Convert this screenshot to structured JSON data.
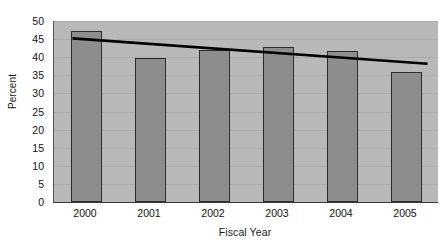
{
  "chart_data": {
    "type": "bar",
    "title": "",
    "subtitle": "",
    "xlabel": "Fiscal Year",
    "ylabel": "Percent",
    "categories": [
      "2000",
      "2001",
      "2002",
      "2003",
      "2004",
      "2005"
    ],
    "values": [
      47.2,
      39.8,
      42.0,
      42.8,
      41.7,
      35.8
    ],
    "series": [
      {
        "name": "Percent",
        "type": "bar",
        "values": [
          47.2,
          39.8,
          42.0,
          42.8,
          41.7,
          35.8
        ]
      },
      {
        "name": "Linear trend",
        "type": "line",
        "endpoints": [
          45.2,
          38.2
        ],
        "values": [
          45.2,
          43.8,
          42.4,
          41.0,
          39.6,
          38.2
        ]
      }
    ],
    "ylim": [
      0,
      50
    ],
    "xlim_categories": 6,
    "ytick_step": 5,
    "yticks": [
      0,
      5,
      10,
      15,
      20,
      25,
      30,
      35,
      40,
      45,
      50
    ],
    "ytick_labels": [
      "0",
      "5",
      "10",
      "15",
      "20",
      "25",
      "30",
      "35",
      "40",
      "45",
      "50"
    ],
    "xtick_labels": [
      "2000",
      "2001",
      "2002",
      "2003",
      "2004",
      "2005"
    ],
    "grid": true,
    "grid_axis": "y",
    "legend": false,
    "legend_position": "none",
    "annotations": [],
    "colors": {
      "bar_fill": "#8e8e8e",
      "bar_border": "#2b2b2b",
      "plot_background": "#b9b9b9",
      "figure_background": "#ffffff",
      "gridline": "#ababab",
      "axis_line": "#3a3a3a",
      "trend_line": "#000000",
      "text": "#111111"
    }
  }
}
